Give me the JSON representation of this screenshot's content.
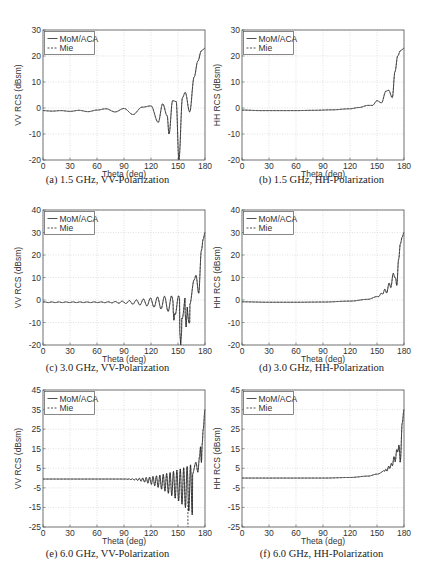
{
  "chart_data": [
    {
      "id": "a",
      "type": "line",
      "caption": "(a)  1.5 GHz, VV-Polarization",
      "xlabel": "Theta (deg)",
      "ylabel": "VV RCS (dBsm)",
      "xlim": [
        0,
        180
      ],
      "ylim": [
        -20,
        30
      ],
      "xticks": [
        0,
        30,
        60,
        90,
        120,
        150,
        180
      ],
      "yticks": [
        -20,
        -10,
        0,
        10,
        20,
        30
      ],
      "grid": true,
      "legend": {
        "position": "upper-left",
        "entries": [
          "MoM/ACA",
          "Mie"
        ]
      },
      "series": [
        {
          "name": "MoM/ACA",
          "style": "solid",
          "x": [
            0,
            10,
            20,
            30,
            40,
            50,
            60,
            70,
            80,
            90,
            100,
            110,
            120,
            128,
            133,
            138,
            140,
            144,
            148,
            151,
            155,
            158,
            163,
            168,
            172,
            176,
            180
          ],
          "y": [
            -1,
            -1.2,
            -1,
            -1.3,
            -0.9,
            -1.4,
            -0.8,
            -0.3,
            -1.5,
            -0.2,
            -2.5,
            0.3,
            0.8,
            -5.5,
            1.6,
            -3,
            -10,
            2.8,
            2.5,
            -20,
            4,
            6,
            -1.5,
            12,
            18,
            22,
            23
          ]
        },
        {
          "name": "Mie",
          "style": "dashed",
          "note": "overlaps MoM/ACA"
        }
      ]
    },
    {
      "id": "b",
      "type": "line",
      "caption": "(b)  1.5 GHz, HH-Polarization",
      "xlabel": "Theta (deg)",
      "ylabel": "HH RCS (dBsm)",
      "xlim": [
        0,
        180
      ],
      "ylim": [
        -20,
        30
      ],
      "xticks": [
        0,
        30,
        60,
        90,
        120,
        150,
        180
      ],
      "yticks": [
        -20,
        -10,
        0,
        10,
        20,
        30
      ],
      "grid": true,
      "legend": {
        "position": "upper-left",
        "entries": [
          "MoM/ACA",
          "Mie"
        ]
      },
      "series": [
        {
          "name": "MoM/ACA",
          "style": "solid",
          "x": [
            0,
            20,
            40,
            60,
            80,
            100,
            120,
            130,
            140,
            145,
            150,
            155,
            160,
            163,
            167,
            170,
            173,
            176,
            180
          ],
          "y": [
            -0.8,
            -1,
            -1,
            -1,
            -0.9,
            -0.7,
            -0.3,
            0.2,
            1,
            1,
            2.8,
            2,
            6.5,
            6.8,
            4,
            14,
            20,
            22,
            23
          ]
        },
        {
          "name": "Mie",
          "style": "dashed",
          "note": "overlaps MoM/ACA"
        }
      ]
    },
    {
      "id": "c",
      "type": "line",
      "caption": "(c)  3.0 GHz, VV-Polarization",
      "xlabel": "Theta (deg)",
      "ylabel": "VV RCS (dBsm)",
      "xlim": [
        0,
        180
      ],
      "ylim": [
        -20,
        40
      ],
      "xticks": [
        0,
        30,
        60,
        90,
        120,
        150,
        180
      ],
      "yticks": [
        -20,
        -10,
        0,
        10,
        20,
        30,
        40
      ],
      "grid": true,
      "legend": {
        "position": "upper-left",
        "entries": [
          "MoM/ACA",
          "Mie"
        ]
      },
      "series": [
        {
          "name": "MoM/ACA",
          "style": "solid",
          "description": "flat near -1 dBsm until ~80 deg, growing oscillations with nulls near 145 (-9), 153 (-20), 159 (-12); rises to ~30 dBsm at 180",
          "x": [
            0,
            30,
            60,
            80,
            100,
            120,
            140,
            145,
            153,
            159,
            165,
            170,
            173,
            176,
            180
          ],
          "y": [
            -1,
            -1,
            -1,
            -1,
            -1.5,
            -3,
            -5,
            -9,
            -20,
            -12,
            6,
            11,
            3,
            22,
            30
          ]
        },
        {
          "name": "Mie",
          "style": "dashed",
          "note": "overlaps MoM/ACA"
        }
      ]
    },
    {
      "id": "d",
      "type": "line",
      "caption": "(d)  3.0 GHz, HH-Polarization",
      "xlabel": "Theta (deg)",
      "ylabel": "HH RCS (dBsm)",
      "xlim": [
        0,
        180
      ],
      "ylim": [
        -20,
        40
      ],
      "xticks": [
        0,
        30,
        60,
        90,
        120,
        150,
        180
      ],
      "yticks": [
        -20,
        -10,
        0,
        10,
        20,
        30,
        40
      ],
      "grid": true,
      "legend": {
        "position": "upper-left",
        "entries": [
          "MoM/ACA",
          "Mie"
        ]
      },
      "series": [
        {
          "name": "MoM/ACA",
          "style": "solid",
          "x": [
            0,
            30,
            60,
            90,
            120,
            140,
            150,
            160,
            165,
            170,
            172,
            174,
            176,
            178,
            180
          ],
          "y": [
            -0.8,
            -1,
            -1,
            -0.9,
            -0.5,
            0.3,
            1.5,
            4,
            7,
            12,
            6.5,
            18,
            25,
            28,
            30
          ]
        },
        {
          "name": "Mie",
          "style": "dashed",
          "note": "overlaps MoM/ACA"
        }
      ]
    },
    {
      "id": "e",
      "type": "line",
      "caption": "(e)  6.0 GHz, VV-Polarization",
      "xlabel": "Theta (deg)",
      "ylabel": "VV RCS (dBsm)",
      "xlim": [
        0,
        180
      ],
      "ylim": [
        -25,
        45
      ],
      "xticks": [
        0,
        30,
        60,
        90,
        120,
        150,
        180
      ],
      "yticks": [
        -25,
        -15,
        -5,
        5,
        15,
        25,
        35,
        45
      ],
      "grid": true,
      "legend": {
        "position": "upper-left",
        "entries": [
          "MoM/ACA",
          "Mie"
        ]
      },
      "series": [
        {
          "name": "MoM/ACA",
          "style": "solid",
          "description": "flat near 0 dBsm until ~90 deg, dense oscillations growing to about -12 dBsm nulls near 158; rises to ~35 dBsm at 180",
          "x": [
            0,
            90,
            120,
            140,
            158,
            165,
            172,
            175,
            178,
            180
          ],
          "y": [
            0,
            0,
            -1,
            -5,
            -12,
            5,
            10,
            16,
            25,
            35
          ]
        },
        {
          "name": "Mie",
          "style": "dashed",
          "description": "matches MoM/ACA except a deep dashed null reaching -25 dBsm near 161 deg",
          "x": [
            161
          ],
          "y": [
            -25
          ]
        }
      ]
    },
    {
      "id": "f",
      "type": "line",
      "caption": "(f)  6.0 GHz, HH-Polarization",
      "xlabel": "Theta (deg)",
      "ylabel": "HH RCS (dBsm)",
      "xlim": [
        0,
        180
      ],
      "ylim": [
        -25,
        45
      ],
      "xticks": [
        0,
        30,
        60,
        90,
        120,
        150,
        180
      ],
      "yticks": [
        -25,
        -15,
        -5,
        5,
        15,
        25,
        35,
        45
      ],
      "grid": true,
      "legend": {
        "position": "upper-left",
        "entries": [
          "MoM/ACA",
          "Mie"
        ]
      },
      "series": [
        {
          "name": "MoM/ACA",
          "style": "solid",
          "x": [
            0,
            30,
            60,
            90,
            120,
            140,
            150,
            160,
            165,
            170,
            174,
            176,
            178,
            180
          ],
          "y": [
            0,
            0,
            0,
            0,
            0.3,
            1,
            2,
            4,
            6,
            10,
            16,
            9,
            28,
            35
          ]
        },
        {
          "name": "Mie",
          "style": "dashed",
          "note": "overlaps MoM/ACA"
        }
      ]
    }
  ],
  "panels": {
    "a": {
      "caption": "(a)  1.5 GHz, VV-Polarization"
    },
    "b": {
      "caption": "(b)  1.5 GHz, HH-Polarization"
    },
    "c": {
      "caption": "(c)  3.0 GHz, VV-Polarization"
    },
    "d": {
      "caption": "(d)  3.0 GHz, HH-Polarization"
    },
    "e": {
      "caption": "(e)  6.0 GHz, VV-Polarization"
    },
    "f": {
      "caption": "(f)  6.0 GHz, HH-Polarization"
    }
  },
  "colors": {
    "line": "#222222",
    "grid": "#cfcfcf",
    "frame": "#555555"
  }
}
